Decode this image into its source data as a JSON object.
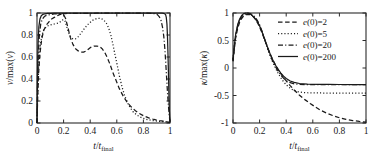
{
  "figure": {
    "panels": [
      "velocity-panel",
      "curvature-panel"
    ]
  },
  "legend": {
    "position": "top-right",
    "entries": [
      {
        "label": "e(0)=2",
        "style": "dashed",
        "var": "e",
        "arg": "(0)",
        "eq": "=2"
      },
      {
        "label": "e(0)=5",
        "style": "dotted",
        "var": "e",
        "arg": "(0)",
        "eq": "=5"
      },
      {
        "label": "e(0)=20",
        "style": "dashdot",
        "var": "e",
        "arg": "(0)",
        "eq": "=20"
      },
      {
        "label": "e(0)=200",
        "style": "solid",
        "var": "e",
        "arg": "(0)",
        "eq": "=200"
      }
    ]
  },
  "chart_data": [
    {
      "id": "velocity-panel",
      "type": "line",
      "title": "",
      "xlabel": "t/t_final",
      "ylabel": "v/max(v)",
      "xlim": [
        0,
        1
      ],
      "ylim": [
        0,
        1
      ],
      "xticks": [
        0,
        0.2,
        0.4,
        0.6,
        0.8,
        1
      ],
      "xticklabels": [
        "0",
        "0.2",
        "0.4",
        "0.6",
        "0.8",
        "1"
      ],
      "yticks": [
        0,
        0.2,
        0.4,
        0.6,
        0.8,
        1
      ],
      "yticklabels": [
        "0",
        "0.2",
        "0.4",
        "0.6",
        "0.8",
        "1"
      ],
      "grid": false,
      "legend": false,
      "series": [
        {
          "name": "e(0)=2",
          "style": "dashed",
          "x": [
            0,
            0.005,
            0.012,
            0.022,
            0.035,
            0.05,
            0.07,
            0.09,
            0.11,
            0.13,
            0.15,
            0.17,
            0.185,
            0.2,
            0.215,
            0.23,
            0.25,
            0.27,
            0.29,
            0.31,
            0.33,
            0.35,
            0.37,
            0.4,
            0.43,
            0.45,
            0.47,
            0.49,
            0.51,
            0.53,
            0.55,
            0.57,
            0.59,
            0.62,
            0.65,
            0.68,
            0.71,
            0.74,
            0.77,
            0.8,
            0.84,
            0.88,
            0.92,
            0.95,
            0.97,
            0.985,
            1.0
          ],
          "y": [
            0,
            0.22,
            0.45,
            0.63,
            0.76,
            0.84,
            0.89,
            0.92,
            0.945,
            0.96,
            0.975,
            0.985,
            0.99,
            0.985,
            0.95,
            0.88,
            0.78,
            0.715,
            0.675,
            0.655,
            0.645,
            0.645,
            0.655,
            0.685,
            0.7,
            0.7,
            0.695,
            0.675,
            0.64,
            0.59,
            0.53,
            0.46,
            0.4,
            0.31,
            0.24,
            0.185,
            0.145,
            0.112,
            0.086,
            0.066,
            0.046,
            0.032,
            0.022,
            0.016,
            0.012,
            0.009,
            0.006
          ]
        },
        {
          "name": "e(0)=5",
          "style": "dotted",
          "x": [
            0,
            0.005,
            0.012,
            0.022,
            0.035,
            0.05,
            0.07,
            0.09,
            0.11,
            0.13,
            0.15,
            0.17,
            0.19,
            0.2,
            0.21,
            0.22,
            0.235,
            0.25,
            0.27,
            0.29,
            0.31,
            0.33,
            0.36,
            0.39,
            0.42,
            0.45,
            0.47,
            0.49,
            0.51,
            0.525,
            0.54,
            0.555,
            0.57,
            0.585,
            0.6,
            0.62,
            0.64,
            0.66,
            0.69,
            0.72,
            0.75,
            0.79,
            0.83,
            0.87,
            0.91,
            0.95,
            0.97,
            0.985,
            1.0
          ],
          "y": [
            0,
            0.26,
            0.5,
            0.68,
            0.79,
            0.845,
            0.875,
            0.888,
            0.895,
            0.9,
            0.905,
            0.915,
            0.935,
            0.94,
            0.93,
            0.89,
            0.83,
            0.79,
            0.765,
            0.765,
            0.785,
            0.815,
            0.865,
            0.905,
            0.935,
            0.95,
            0.952,
            0.945,
            0.925,
            0.9,
            0.86,
            0.8,
            0.72,
            0.63,
            0.545,
            0.425,
            0.325,
            0.245,
            0.16,
            0.105,
            0.072,
            0.046,
            0.031,
            0.022,
            0.016,
            0.012,
            0.01,
            0.008,
            0.005
          ]
        },
        {
          "name": "e(0)=20",
          "style": "dashdot",
          "x": [
            0,
            0.004,
            0.01,
            0.018,
            0.028,
            0.04,
            0.055,
            0.07,
            0.09,
            0.11,
            0.13,
            0.15,
            0.17,
            0.19,
            0.21,
            0.23,
            0.26,
            0.29,
            0.33,
            0.37,
            0.41,
            0.45,
            0.5,
            0.55,
            0.6,
            0.65,
            0.7,
            0.75,
            0.79,
            0.83,
            0.86,
            0.885,
            0.905,
            0.92,
            0.933,
            0.944,
            0.953,
            0.961,
            0.968,
            0.974,
            0.98,
            0.986,
            0.992,
            0.997,
            1.0
          ],
          "y": [
            0,
            0.33,
            0.62,
            0.8,
            0.9,
            0.945,
            0.968,
            0.978,
            0.984,
            0.988,
            0.991,
            0.993,
            0.994,
            0.9945,
            0.995,
            0.9955,
            0.996,
            0.9965,
            0.997,
            0.9972,
            0.9975,
            0.9978,
            0.998,
            0.9982,
            0.9984,
            0.9986,
            0.9988,
            0.999,
            0.999,
            0.9988,
            0.9975,
            0.994,
            0.985,
            0.965,
            0.93,
            0.87,
            0.79,
            0.68,
            0.55,
            0.42,
            0.3,
            0.19,
            0.105,
            0.04,
            0.012
          ]
        },
        {
          "name": "e(0)=200",
          "style": "solid",
          "x": [
            0,
            0.003,
            0.008,
            0.014,
            0.022,
            0.032,
            0.045,
            0.06,
            0.08,
            0.1,
            0.13,
            0.16,
            0.2,
            0.25,
            0.3,
            0.36,
            0.42,
            0.48,
            0.54,
            0.6,
            0.66,
            0.72,
            0.78,
            0.84,
            0.89,
            0.92,
            0.94,
            0.952,
            0.96,
            0.967,
            0.972,
            0.977,
            0.981,
            0.985,
            0.989,
            0.992,
            0.995,
            0.998,
            1.0
          ],
          "y": [
            0,
            0.4,
            0.72,
            0.875,
            0.945,
            0.975,
            0.988,
            0.993,
            0.996,
            0.997,
            0.998,
            0.9985,
            0.999,
            0.9992,
            0.9993,
            0.9994,
            0.9995,
            0.9995,
            0.9996,
            0.9996,
            0.9996,
            0.9996,
            0.9996,
            0.9995,
            0.9993,
            0.999,
            0.9985,
            0.997,
            0.993,
            0.985,
            0.96,
            0.9,
            0.79,
            0.62,
            0.42,
            0.25,
            0.12,
            0.04,
            0.012
          ]
        }
      ]
    },
    {
      "id": "curvature-panel",
      "type": "line",
      "title": "",
      "xlabel": "t/t_final",
      "ylabel": "kappa/max(kappa)",
      "xlim": [
        0,
        1
      ],
      "ylim": [
        -1,
        1
      ],
      "xticks": [
        0,
        0.2,
        0.4,
        0.6,
        0.8,
        1
      ],
      "xticklabels": [
        "0",
        "0.2",
        "0.4",
        "0.6",
        "0.8",
        "1"
      ],
      "yticks": [
        -1,
        -0.5,
        0,
        0.5,
        1
      ],
      "yticklabels": [
        "-1",
        "-0.5",
        "0",
        "0.5",
        "1"
      ],
      "grid": false,
      "legend": true,
      "series": [
        {
          "name": "e(0)=2",
          "style": "dashed",
          "x": [
            0,
            0.01,
            0.02,
            0.035,
            0.05,
            0.065,
            0.08,
            0.095,
            0.11,
            0.125,
            0.14,
            0.155,
            0.17,
            0.185,
            0.2,
            0.22,
            0.24,
            0.26,
            0.28,
            0.3,
            0.32,
            0.34,
            0.37,
            0.4,
            0.43,
            0.46,
            0.5,
            0.54,
            0.58,
            0.62,
            0.66,
            0.7,
            0.75,
            0.8,
            0.85,
            0.9,
            0.95,
            1.0
          ],
          "y": [
            0.12,
            0.35,
            0.55,
            0.72,
            0.83,
            0.9,
            0.945,
            0.968,
            0.975,
            0.972,
            0.955,
            0.925,
            0.88,
            0.82,
            0.745,
            0.63,
            0.5,
            0.37,
            0.25,
            0.145,
            0.05,
            -0.03,
            -0.14,
            -0.235,
            -0.32,
            -0.4,
            -0.495,
            -0.575,
            -0.645,
            -0.71,
            -0.77,
            -0.815,
            -0.865,
            -0.905,
            -0.935,
            -0.955,
            -0.972,
            -0.985
          ]
        },
        {
          "name": "e(0)=5",
          "style": "dotted",
          "x": [
            0,
            0.01,
            0.02,
            0.035,
            0.05,
            0.065,
            0.08,
            0.095,
            0.11,
            0.125,
            0.14,
            0.155,
            0.17,
            0.185,
            0.2,
            0.22,
            0.24,
            0.26,
            0.28,
            0.3,
            0.32,
            0.34,
            0.36,
            0.38,
            0.4,
            0.42,
            0.44,
            0.46,
            0.48,
            0.52,
            0.56,
            0.62,
            0.7,
            0.8,
            0.9,
            1.0
          ],
          "y": [
            0.16,
            0.4,
            0.6,
            0.77,
            0.875,
            0.935,
            0.968,
            0.982,
            0.985,
            0.978,
            0.962,
            0.935,
            0.895,
            0.84,
            0.77,
            0.645,
            0.5,
            0.355,
            0.22,
            0.1,
            -0.005,
            -0.1,
            -0.18,
            -0.25,
            -0.305,
            -0.35,
            -0.385,
            -0.41,
            -0.428,
            -0.443,
            -0.45,
            -0.453,
            -0.455,
            -0.455,
            -0.455,
            -0.455
          ]
        },
        {
          "name": "e(0)=20",
          "style": "dashdot",
          "x": [
            0,
            0.01,
            0.02,
            0.035,
            0.05,
            0.065,
            0.08,
            0.095,
            0.11,
            0.125,
            0.14,
            0.155,
            0.17,
            0.185,
            0.2,
            0.22,
            0.24,
            0.26,
            0.28,
            0.3,
            0.32,
            0.34,
            0.36,
            0.38,
            0.4,
            0.43,
            0.46,
            0.5,
            0.56,
            0.64,
            0.72,
            0.8,
            0.9,
            1.0
          ],
          "y": [
            0.13,
            0.38,
            0.58,
            0.755,
            0.865,
            0.935,
            0.975,
            0.995,
            1.0,
            0.995,
            0.978,
            0.95,
            0.91,
            0.855,
            0.785,
            0.655,
            0.51,
            0.365,
            0.23,
            0.115,
            0.02,
            -0.062,
            -0.13,
            -0.185,
            -0.228,
            -0.267,
            -0.287,
            -0.298,
            -0.302,
            -0.303,
            -0.303,
            -0.303,
            -0.303,
            -0.303
          ]
        },
        {
          "name": "e(0)=200",
          "style": "solid",
          "x": [
            0,
            0.01,
            0.02,
            0.035,
            0.05,
            0.065,
            0.08,
            0.095,
            0.11,
            0.125,
            0.14,
            0.155,
            0.17,
            0.185,
            0.2,
            0.22,
            0.24,
            0.26,
            0.28,
            0.3,
            0.32,
            0.34,
            0.36,
            0.38,
            0.4,
            0.43,
            0.46,
            0.5,
            0.56,
            0.64,
            0.72,
            0.8,
            0.9,
            1.0
          ],
          "y": [
            0.14,
            0.4,
            0.61,
            0.785,
            0.89,
            0.955,
            0.988,
            1.0,
            0.998,
            0.985,
            0.962,
            0.93,
            0.888,
            0.835,
            0.765,
            0.645,
            0.51,
            0.375,
            0.25,
            0.14,
            0.05,
            -0.028,
            -0.093,
            -0.148,
            -0.192,
            -0.237,
            -0.262,
            -0.282,
            -0.294,
            -0.298,
            -0.299,
            -0.3,
            -0.3,
            -0.3
          ]
        }
      ]
    }
  ]
}
